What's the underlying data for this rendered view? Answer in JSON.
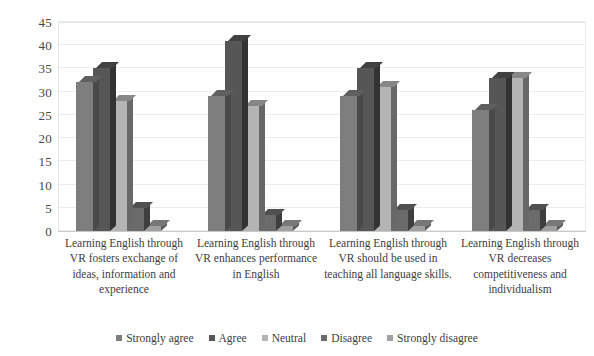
{
  "chart_data": {
    "type": "bar",
    "title": "",
    "subtitle": "",
    "xlabel": "",
    "ylabel": "",
    "ylim": [
      0,
      45
    ],
    "ytick_step": 5,
    "yticks": [
      "45",
      "40",
      "35",
      "30",
      "25",
      "20",
      "15",
      "10",
      "5",
      "0"
    ],
    "grid": true,
    "legend_position": "bottom",
    "style": "3d-clustered-column",
    "categories": [
      "Learning English through VR fosters exchange of ideas, information and experience",
      "Learning English through VR enhances performance in English",
      "Learning English through VR should be used in teaching all language skills.",
      "Learning English through VR decreases competitiveness and individualism"
    ],
    "series": [
      {
        "name": "Strongly agree",
        "color": "#7e7e7e",
        "values": [
          32,
          29,
          29,
          26
        ]
      },
      {
        "name": "Agree",
        "color": "#565656",
        "values": [
          35,
          41,
          35,
          33
        ]
      },
      {
        "name": "Neutral",
        "color": "#b4b4b4",
        "values": [
          28,
          27,
          31,
          33
        ]
      },
      {
        "name": "Disagree",
        "color": "#6b6b6b",
        "values": [
          5,
          3.5,
          4.5,
          4.5
        ]
      },
      {
        "name": "Strongly disagree",
        "color": "#a0a0a0",
        "values": [
          1,
          1,
          1,
          1
        ]
      }
    ]
  },
  "legend": {
    "items": [
      {
        "label": "Strongly agree",
        "color": "#7e7e7e"
      },
      {
        "label": "Agree",
        "color": "#565656"
      },
      {
        "label": "Neutral",
        "color": "#b4b4b4"
      },
      {
        "label": "Disagree",
        "color": "#6b6b6b"
      },
      {
        "label": "Strongly disagree",
        "color": "#a0a0a0"
      }
    ]
  },
  "colors": {
    "background": "#ffffff",
    "gridline": "#ececec",
    "axis": "#c9c9c9",
    "text": "#3d3d3d"
  }
}
